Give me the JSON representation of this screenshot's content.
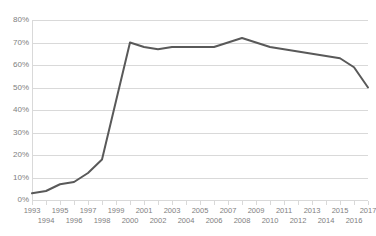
{
  "chart_data": {
    "type": "line",
    "title": "",
    "subtitle": "",
    "xlabel": "",
    "ylabel": "",
    "x": [
      1993,
      1994,
      1995,
      1996,
      1997,
      1998,
      1999,
      2000,
      2001,
      2002,
      2003,
      2004,
      2005,
      2006,
      2007,
      2008,
      2009,
      2010,
      2011,
      2012,
      2013,
      2014,
      2015,
      2016,
      2017
    ],
    "categories": [
      "1993",
      "1994",
      "1995",
      "1996",
      "1997",
      "1998",
      "1999",
      "2000",
      "2001",
      "2002",
      "2003",
      "2004",
      "2005",
      "2006",
      "2007",
      "2008",
      "2009",
      "2010",
      "2011",
      "2012",
      "2013",
      "2014",
      "2015",
      "2016",
      "2017"
    ],
    "values": [
      3,
      4,
      7,
      8,
      12,
      18,
      44,
      70,
      68,
      67,
      68,
      68,
      68,
      68,
      70,
      72,
      70,
      68,
      67,
      66,
      65,
      64,
      63,
      59,
      50
    ],
    "series": [
      {
        "name": "Series 1",
        "color": "#595959",
        "values": [
          3,
          4,
          7,
          8,
          12,
          18,
          44,
          70,
          68,
          67,
          68,
          68,
          68,
          68,
          70,
          72,
          70,
          68,
          67,
          66,
          65,
          64,
          63,
          59,
          50
        ]
      }
    ],
    "ylim": [
      0,
      80
    ],
    "y_ticks": [
      0,
      10,
      20,
      30,
      40,
      50,
      60,
      70,
      80
    ],
    "y_tick_labels": [
      "0%",
      "10%",
      "20%",
      "30%",
      "40%",
      "50%",
      "60%",
      "70%",
      "80%"
    ],
    "xlim": [
      1993,
      2017
    ],
    "x_tick_labels_top": [
      "1993",
      "1995",
      "1997",
      "1999",
      "2001",
      "2003",
      "2005",
      "2007",
      "2009",
      "2011",
      "2013",
      "2015",
      "2017"
    ],
    "x_tick_labels_bottom": [
      "1994",
      "1996",
      "1998",
      "2000",
      "2002",
      "2004",
      "2006",
      "2008",
      "2010",
      "2012",
      "2014",
      "2016"
    ],
    "grid": true,
    "grid_color": "#d9d9d9",
    "legend": false,
    "legend_position": "none",
    "line_color": "#595959",
    "line_width": 2,
    "markers": false,
    "value_suffix": "%"
  }
}
